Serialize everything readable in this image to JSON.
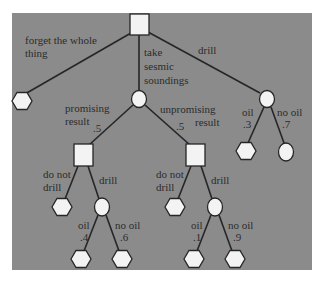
{
  "diagram": {
    "type": "decision-tree",
    "colors": {
      "background": "#8b8b8b",
      "node_fill": "#f3f3f3",
      "stroke": "#262626",
      "text": "#2b2b2b"
    },
    "root": {
      "kind": "decision",
      "shape": "square"
    },
    "root_branches": {
      "forget": {
        "label_line1": "forget the whole",
        "label_line2": "thing",
        "outcome": "terminal"
      },
      "seismic": {
        "label_line1": "take",
        "label_line2": "sesmic",
        "label_line3": "soundings",
        "node": "chance"
      },
      "drill": {
        "label": "drill",
        "node": "chance"
      }
    },
    "seismic_branches": {
      "promising": {
        "label_line1": "promising",
        "label_line2": "result",
        "probability": ".5",
        "node": "decision"
      },
      "unpromising": {
        "label_line1": "unpromising",
        "label_line2": "result",
        "probability": ".5",
        "node": "decision"
      }
    },
    "promising_decision": {
      "do_not_drill_line1": "do not",
      "do_not_drill_line2": "drill",
      "drill": "drill",
      "oil_label": "oil",
      "oil_prob": ".4",
      "no_oil_label": "no oil",
      "no_oil_prob": ".6"
    },
    "unpromising_decision": {
      "do_not_drill_line1": "do not",
      "do_not_drill_line2": "drill",
      "drill": "drill",
      "oil_label": "oil",
      "oil_prob": ".1",
      "no_oil_label": "no oil",
      "no_oil_prob": ".9"
    },
    "direct_drill": {
      "oil_label": "oil",
      "oil_prob": ".3",
      "no_oil_label": "no oil",
      "no_oil_prob": ".7"
    }
  }
}
